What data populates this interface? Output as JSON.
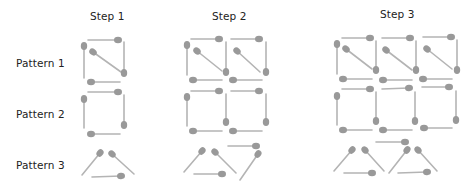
{
  "headers": [
    {
      "label": "Step 1",
      "x": 90,
      "y": 10
    },
    {
      "label": "Step 2",
      "x": 212,
      "y": 10
    },
    {
      "label": "Step 3",
      "x": 380,
      "y": 8
    }
  ],
  "rows": [
    {
      "label": "Pattern 1",
      "x": 16,
      "y": 57
    },
    {
      "label": "Pattern 2",
      "x": 16,
      "y": 108
    },
    {
      "label": "Pattern 3",
      "x": 16,
      "y": 159
    }
  ],
  "style": {
    "stick_color": "#b4b4b4",
    "head_color": "#999999",
    "text_color": "#222222"
  },
  "matchsticks": [
    {
      "pattern": 1,
      "step": 1,
      "sticks": [
        [
          88,
          40,
          118,
          40
        ],
        [
          84,
          78,
          84,
          46
        ],
        [
          121,
          72,
          93,
          52
        ],
        [
          124,
          42,
          124,
          73
        ],
        [
          120,
          82,
          91,
          82
        ]
      ]
    },
    {
      "pattern": 1,
      "step": 2,
      "sticks": [
        [
          191,
          39,
          219,
          39
        ],
        [
          187,
          75,
          187,
          45
        ],
        [
          222,
          71,
          197,
          51
        ],
        [
          226,
          42,
          226,
          72
        ],
        [
          222,
          80,
          193,
          80
        ],
        [
          231,
          39,
          259,
          39
        ],
        [
          260,
          72,
          237,
          51
        ],
        [
          266,
          42,
          266,
          72
        ],
        [
          262,
          80,
          233,
          80
        ]
      ]
    },
    {
      "pattern": 1,
      "step": 3,
      "sticks": [
        [
          342,
          38,
          370,
          38
        ],
        [
          337,
          74,
          337,
          44
        ],
        [
          372,
          69,
          346,
          49
        ],
        [
          376,
          41,
          376,
          70
        ],
        [
          372,
          79,
          343,
          79
        ],
        [
          382,
          38,
          410,
          38
        ],
        [
          412,
          70,
          386,
          50
        ],
        [
          416,
          41,
          416,
          70
        ],
        [
          412,
          80,
          383,
          80
        ],
        [
          423,
          37,
          451,
          37
        ],
        [
          452,
          69,
          427,
          49
        ],
        [
          457,
          40,
          457,
          70
        ],
        [
          452,
          79,
          423,
          79
        ]
      ]
    },
    {
      "pattern": 2,
      "step": 1,
      "sticks": [
        [
          88,
          92,
          118,
          92
        ],
        [
          84,
          128,
          84,
          99
        ],
        [
          124,
          95,
          124,
          125
        ],
        [
          120,
          134,
          91,
          134
        ]
      ]
    },
    {
      "pattern": 2,
      "step": 2,
      "sticks": [
        [
          191,
          91,
          219,
          91
        ],
        [
          187,
          126,
          187,
          97
        ],
        [
          226,
          94,
          226,
          122
        ],
        [
          222,
          131,
          193,
          131
        ],
        [
          231,
          91,
          259,
          91
        ],
        [
          266,
          94,
          266,
          122
        ],
        [
          262,
          131,
          233,
          131
        ]
      ]
    },
    {
      "pattern": 2,
      "step": 3,
      "sticks": [
        [
          342,
          89,
          370,
          89
        ],
        [
          337,
          125,
          337,
          96
        ],
        [
          376,
          92,
          376,
          121
        ],
        [
          372,
          130,
          343,
          130
        ],
        [
          382,
          89,
          409,
          88
        ],
        [
          415,
          92,
          415,
          121
        ],
        [
          412,
          130,
          383,
          130
        ],
        [
          422,
          87,
          449,
          87
        ],
        [
          456,
          91,
          456,
          120
        ],
        [
          452,
          128,
          424,
          128
        ]
      ]
    },
    {
      "pattern": 3,
      "step": 1,
      "sticks": [
        [
          82,
          175,
          100,
          153
        ],
        [
          134,
          174,
          112,
          154
        ],
        [
          92,
          177,
          121,
          176
        ]
      ]
    },
    {
      "pattern": 3,
      "step": 2,
      "sticks": [
        [
          184,
          172,
          202,
          151
        ],
        [
          236,
          173,
          215,
          152
        ],
        [
          194,
          174,
          222,
          174
        ],
        [
          228,
          146,
          256,
          146
        ],
        [
          240,
          180,
          258,
          154
        ]
      ]
    },
    {
      "pattern": 3,
      "step": 3,
      "sticks": [
        [
          334,
          171,
          352,
          150
        ],
        [
          384,
          171,
          365,
          150
        ],
        [
          344,
          173,
          372,
          173
        ],
        [
          376,
          142,
          405,
          142
        ],
        [
          389,
          173,
          407,
          150
        ],
        [
          437,
          171,
          418,
          150
        ],
        [
          398,
          173,
          427,
          172
        ]
      ]
    }
  ]
}
